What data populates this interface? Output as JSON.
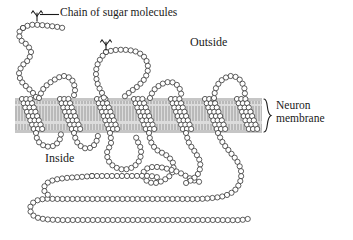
{
  "figure": {
    "background_color": "#ffffff",
    "width": 353,
    "height": 240
  },
  "labels": {
    "sugar_chain": "Chain of sugar molecules",
    "outside": "Outside",
    "inside": "Inside",
    "membrane_line1": "Neuron",
    "membrane_line2": "membrane"
  },
  "icons": {
    "sugar_marker": "branched-sugar-icon",
    "brace": "curly-brace-icon",
    "leader_line": "leader-line-icon"
  },
  "colors": {
    "outline": "#2a2a2a",
    "circle_fill": "#ffffff",
    "membrane_band": "#d8d8d8",
    "membrane_stripe": "#9a9a9a",
    "membrane_edge": "#bdbdbd",
    "text": "#1a1a1a"
  },
  "membrane": {
    "top_y": 98,
    "bottom_y": 133,
    "left_x": 15,
    "right_x": 262,
    "stripe_count": 84
  },
  "structure": {
    "transmembrane_helix_count": 7,
    "glycosylation_site_count": 2,
    "residue_circle_radius": 2.6,
    "residue_spacing": 5.0,
    "helix_x_starts": [
      22,
      60,
      97,
      134,
      171,
      205,
      237
    ]
  }
}
